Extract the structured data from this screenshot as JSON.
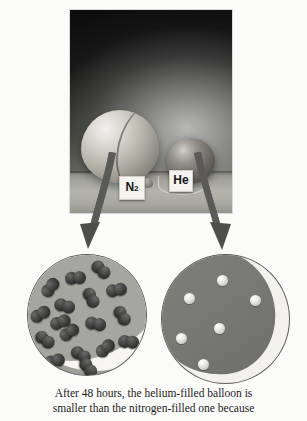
{
  "figure": {
    "caption_lines": [
      "After 48 hours, the helium-filled balloon is",
      "smaller than the nitrogen-filled one because"
    ]
  },
  "photo": {
    "alt_name": "photograph-of-two-balloons",
    "labels": {
      "nitrogen_tag": "N",
      "nitrogen_tag_sub": "2",
      "helium_tag": "He"
    }
  },
  "insets": {
    "nitrogen": {
      "name": "nitrogen-balloon-magnified-view",
      "particle_type": "diatomic-molecule",
      "particle_count": 17,
      "particles": [
        {
          "x": 12,
          "y": 25
        },
        {
          "x": 37,
          "y": 16
        },
        {
          "x": 62,
          "y": 8
        },
        {
          "x": 2,
          "y": 52
        },
        {
          "x": 26,
          "y": 44
        },
        {
          "x": 52,
          "y": 36
        },
        {
          "x": 78,
          "y": 28
        },
        {
          "x": 6,
          "y": 78
        },
        {
          "x": 31,
          "y": 70
        },
        {
          "x": 57,
          "y": 62
        },
        {
          "x": 83,
          "y": 54
        },
        {
          "x": 16,
          "y": 99
        },
        {
          "x": 42,
          "y": 93
        },
        {
          "x": 67,
          "y": 86
        },
        {
          "x": 90,
          "y": 80
        },
        {
          "x": 49,
          "y": 106
        },
        {
          "x": 22,
          "y": 60
        }
      ]
    },
    "helium": {
      "name": "helium-balloon-magnified-view",
      "particle_type": "single-atom",
      "particle_count": 6,
      "particles": [
        {
          "x": 55,
          "y": 20
        },
        {
          "x": 22,
          "y": 38
        },
        {
          "x": 88,
          "y": 40
        },
        {
          "x": 52,
          "y": 68
        },
        {
          "x": 14,
          "y": 78
        },
        {
          "x": 36,
          "y": 104
        }
      ]
    }
  },
  "arrows": {
    "left_arrow_name": "arrow-to-nitrogen-inset",
    "right_arrow_name": "arrow-to-helium-inset",
    "color": "#5a5a57"
  },
  "colors": {
    "page_background": "#fbfbfa",
    "photo_background": "#0d0d0e",
    "inset_gray": "#a6a6a0",
    "inset_dark_gray": "#7a7a75",
    "highlight_white": "#f6f5f1",
    "molecule_dark": "#323231",
    "atom_light": "#f0efe9",
    "caption_text": "#1b1b1b"
  }
}
